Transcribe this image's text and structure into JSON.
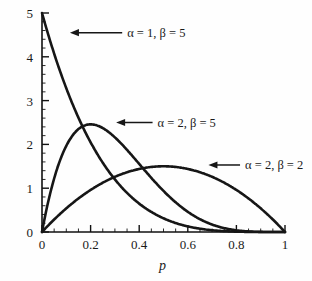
{
  "chart_data": {
    "type": "line",
    "title": "",
    "subtitle": "",
    "xlabel": "p",
    "ylabel": "",
    "xlim": [
      0,
      1
    ],
    "ylim": [
      0,
      5
    ],
    "grid": false,
    "legend_position": "inline-annotations",
    "x_ticks": [
      "0",
      "0.2",
      "0.4",
      "0.6",
      "0.8",
      "1"
    ],
    "x_tick_values": [
      0,
      0.2,
      0.4,
      0.6,
      0.8,
      1
    ],
    "x_minor_step": 0.05,
    "y_ticks": [
      "0",
      "1",
      "2",
      "3",
      "4",
      "5"
    ],
    "y_tick_values": [
      0,
      1,
      2,
      3,
      4,
      5
    ],
    "y_minor_step": 0.2,
    "series": [
      {
        "name": "alpha = 1, beta = 5",
        "label": "α = 1, β = 5",
        "alpha": 1,
        "beta": 5,
        "peak_x": 0,
        "peak_y": 5,
        "x": [
          0,
          0.02,
          0.04,
          0.06,
          0.08,
          0.1,
          0.12,
          0.15,
          0.18,
          0.2,
          0.25,
          0.3,
          0.35,
          0.4,
          0.45,
          0.5,
          0.55,
          0.6,
          0.65,
          0.7,
          0.75,
          0.8,
          0.85,
          0.9,
          0.95,
          1
        ],
        "values": [
          5,
          4.52,
          4.08,
          3.68,
          3.31,
          2.95,
          2.64,
          2.23,
          1.86,
          1.64,
          1.19,
          0.84,
          0.58,
          0.39,
          0.25,
          0.16,
          0.09,
          0.05,
          0.02,
          0.01,
          0.003,
          0.001,
          0,
          0,
          0,
          0
        ]
      },
      {
        "name": "alpha = 2, beta = 5",
        "label": "α = 2, β = 5",
        "alpha": 2,
        "beta": 5,
        "peak_x": 0.2,
        "peak_y": 2.46,
        "x": [
          0,
          0.025,
          0.05,
          0.075,
          0.1,
          0.125,
          0.15,
          0.175,
          0.2,
          0.225,
          0.25,
          0.3,
          0.35,
          0.4,
          0.45,
          0.5,
          0.55,
          0.6,
          0.65,
          0.7,
          0.75,
          0.8,
          0.85,
          0.9,
          0.95,
          1
        ],
        "values": [
          0,
          0.84,
          1.57,
          2.06,
          2.33,
          2.45,
          2.46,
          2.4,
          2.46,
          2.26,
          2.11,
          1.8,
          1.46,
          1.17,
          0.9,
          0.66,
          0.46,
          0.31,
          0.18,
          0.1,
          0.05,
          0.02,
          0.005,
          0.001,
          0,
          0
        ]
      },
      {
        "name": "alpha = 2, beta = 2",
        "label": "α = 2, β = 2",
        "alpha": 2,
        "beta": 2,
        "peak_x": 0.5,
        "peak_y": 1.5,
        "x": [
          0,
          0.05,
          0.1,
          0.15,
          0.2,
          0.25,
          0.3,
          0.35,
          0.4,
          0.45,
          0.5,
          0.55,
          0.6,
          0.65,
          0.7,
          0.75,
          0.8,
          0.85,
          0.9,
          0.95,
          1
        ],
        "values": [
          0,
          0.285,
          0.54,
          0.765,
          0.96,
          1.125,
          1.26,
          1.365,
          1.44,
          1.485,
          1.5,
          1.485,
          1.44,
          1.365,
          1.26,
          1.125,
          0.96,
          0.765,
          0.54,
          0.285,
          0
        ]
      }
    ],
    "annotations": [
      {
        "id": "annot-beta-1-5",
        "text": "α = 1, β = 5",
        "arrow_from_x": 0.33,
        "arrow_from_y": 4.55,
        "arrow_to_x": 0.115,
        "arrow_to_y": 4.55
      },
      {
        "id": "annot-beta-2-5",
        "text": "α = 2, β = 5",
        "arrow_from_x": 0.455,
        "arrow_from_y": 2.5,
        "arrow_to_x": 0.305,
        "arrow_to_y": 2.5
      },
      {
        "id": "annot-beta-2-2",
        "text": "α = 2, β = 2",
        "arrow_from_x": 0.815,
        "arrow_from_y": 1.53,
        "arrow_to_x": 0.685,
        "arrow_to_y": 1.53
      }
    ]
  }
}
